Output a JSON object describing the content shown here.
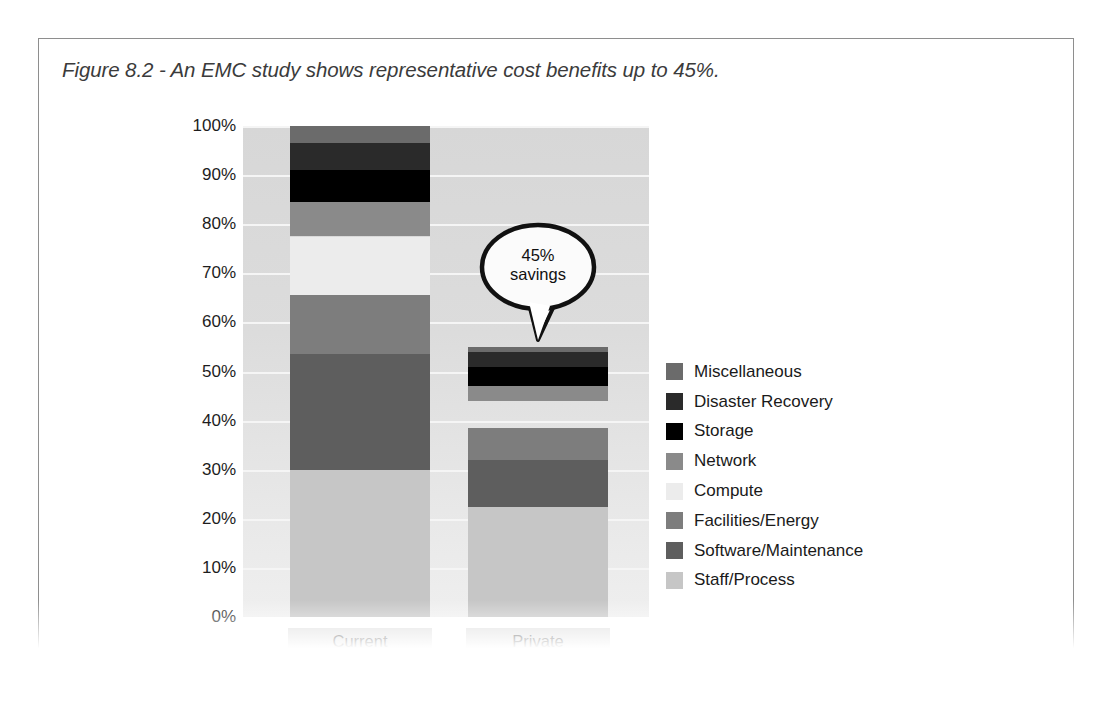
{
  "figure": {
    "caption": "Figure 8.2 - An EMC study shows representative cost benefits up to 45%."
  },
  "callout": {
    "line1": "45%",
    "line2": "savings",
    "text": "45% savings"
  },
  "chart_data": {
    "type": "bar",
    "subtype": "stacked-column",
    "title": "Figure 8.2 - An EMC study shows representative cost benefits up to 45%.",
    "xlabel": "",
    "ylabel": "",
    "categories": [
      "Current",
      "Private"
    ],
    "ylim": [
      0,
      100
    ],
    "ytick_labels": [
      "0%",
      "10%",
      "20%",
      "30%",
      "40%",
      "50%",
      "60%",
      "70%",
      "80%",
      "90%",
      "100%"
    ],
    "ytick_values": [
      0,
      10,
      20,
      30,
      40,
      50,
      60,
      70,
      80,
      90,
      100
    ],
    "grid": true,
    "legend_position": "right",
    "annotation": "45% savings",
    "totals": {
      "Current": 100,
      "Private": 55
    },
    "gap": {
      "category": "Private",
      "from": 38.5,
      "to": 44
    },
    "series": [
      {
        "name": "Miscellaneous",
        "color": "#6b6b6b",
        "values": [
          3.5,
          1.0
        ]
      },
      {
        "name": "Disaster Recovery",
        "color": "#2a2a2a",
        "values": [
          5.5,
          3.0
        ]
      },
      {
        "name": "Storage",
        "color": "#000000",
        "values": [
          6.5,
          4.0
        ]
      },
      {
        "name": "Network",
        "color": "#8a8a8a",
        "values": [
          7.0,
          3.0
        ]
      },
      {
        "name": "Compute",
        "color": "#ececec",
        "values": [
          12.0,
          0.0
        ]
      },
      {
        "name": "Facilities/Energy",
        "color": "#7d7d7d",
        "values": [
          12.0,
          6.5
        ]
      },
      {
        "name": "Software/Maintenance",
        "color": "#5e5e5e",
        "values": [
          23.5,
          9.5
        ]
      },
      {
        "name": "Staff/Process",
        "color": "#c6c6c6",
        "values": [
          30.0,
          22.5
        ]
      }
    ]
  }
}
